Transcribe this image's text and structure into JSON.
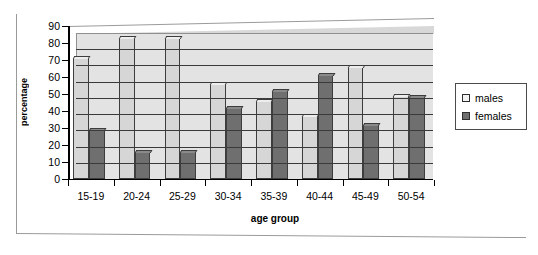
{
  "chart_data": {
    "type": "bar",
    "title": "",
    "xlabel": "age group",
    "ylabel": "percentage",
    "categories": [
      "15-19",
      "20-24",
      "25-29",
      "30-34",
      "35-39",
      "40-44",
      "45-49",
      "50-54"
    ],
    "series": [
      {
        "name": "males",
        "color": "#d6d6d6",
        "values": [
          71,
          83,
          83,
          56,
          46,
          37,
          66,
          49
        ]
      },
      {
        "name": "females",
        "color": "#6f6f6f",
        "values": [
          29,
          16,
          16,
          42,
          52,
          61,
          32,
          48
        ]
      }
    ],
    "ylim": [
      0,
      90
    ],
    "ytick_step": 10,
    "yticks": [
      90,
      80,
      70,
      60,
      50,
      40,
      30,
      20,
      10,
      0
    ],
    "grid": true,
    "grid_axis": "y",
    "legend_position": "right",
    "style": "3d-clustered-column"
  },
  "legend": {
    "items": [
      {
        "label": "males"
      },
      {
        "label": "females"
      }
    ]
  },
  "axes": {
    "y_title": "percentage",
    "x_title": "age group"
  }
}
